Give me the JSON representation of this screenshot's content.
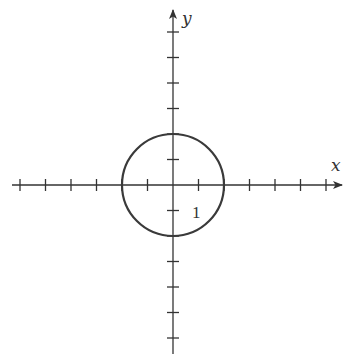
{
  "diagram": {
    "type": "coordinate-plane",
    "axes": {
      "x_label": "x",
      "y_label": "y",
      "x_ticks": [
        -6,
        -5,
        -4,
        -3,
        -2,
        -1,
        1,
        2,
        3,
        4,
        5,
        6
      ],
      "y_ticks": [
        -6,
        -5,
        -4,
        -3,
        -2,
        -1,
        1,
        2,
        3,
        4,
        5,
        6
      ],
      "x_range": [
        -6.5,
        6.5
      ],
      "y_range": [
        -6.5,
        6.5
      ],
      "arrow_positive_ends": true
    },
    "tick_label": "1",
    "circle": {
      "center": [
        0,
        0
      ],
      "radius": 2,
      "equation": "x^2 + y^2 = 4"
    },
    "colors": {
      "ink": "#333333",
      "background": "#ffffff"
    }
  },
  "chart_data": {
    "type": "line",
    "title": "",
    "xlabel": "x",
    "ylabel": "y",
    "xlim": [
      -6.5,
      6.5
    ],
    "ylim": [
      -6.5,
      6.5
    ],
    "grid": false,
    "series": [
      {
        "name": "circle x^2+y^2=4",
        "center": [
          0,
          0
        ],
        "radius": 2,
        "points": [
          [
            2,
            0
          ],
          [
            0,
            2
          ],
          [
            -2,
            0
          ],
          [
            0,
            -2
          ]
        ]
      }
    ],
    "annotations": [
      {
        "text": "1",
        "at": [
          1,
          -1
        ]
      }
    ]
  }
}
